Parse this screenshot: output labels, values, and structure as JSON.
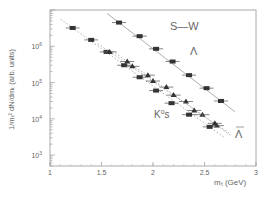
{
  "chart_data": {
    "type": "scatter",
    "title": "",
    "xlabel": "m_t (GeV)",
    "ylabel": "1/m_t^2 dN/dm_t (arb. units)",
    "xlim": [
      1,
      3
    ],
    "ylim": [
      500,
      10000000
    ],
    "yscale": "log",
    "x_ticks": [
      "1",
      "1.5",
      "2",
      "2.5",
      "3"
    ],
    "y_ticks": [
      "10^3",
      "10^4",
      "10^5",
      "10^6"
    ],
    "grid": false,
    "annotations": [
      "S-W",
      "Λ",
      "K°s",
      "Λ̄"
    ],
    "series": [
      {
        "name": "S-W (squares)",
        "marker": "square",
        "line": "solid",
        "x": [
          1.67,
          1.87,
          2.03,
          2.19,
          2.35,
          2.52,
          2.66
        ],
        "y": [
          4500000,
          1900000,
          850000,
          380000,
          160000,
          70000,
          31000
        ]
      },
      {
        "name": "Λ (triangles)",
        "marker": "triangle",
        "line": "dotted",
        "x": [
          1.75,
          1.95,
          2.13,
          2.32,
          2.48,
          2.62
        ],
        "y": [
          380000,
          160000,
          75000,
          30000,
          13000,
          6500
        ]
      },
      {
        "name": "K°s (squares)",
        "marker": "square",
        "line": "dotted",
        "x": [
          1.22,
          1.4,
          1.55,
          1.72,
          1.87,
          2.03,
          2.18,
          2.35,
          2.55
        ],
        "y": [
          3200000,
          1500000,
          700000,
          300000,
          140000,
          60000,
          27000,
          13000,
          6000
        ]
      },
      {
        "name": "Λ̄ (triangles)",
        "marker": "triangle",
        "line": "dotted",
        "x": [
          1.58,
          1.8,
          2.0,
          2.2,
          2.4,
          2.6
        ],
        "y": [
          700000,
          280000,
          110000,
          45000,
          17000,
          7500
        ]
      }
    ]
  },
  "labels": {
    "sw": "S—W",
    "lambda": "Λ",
    "k0s_k": "K",
    "k0s_sup": "o",
    "k0s_s": "s",
    "lambdabar": "Λ",
    "xlabel": "mₜ (GeV)",
    "ylabel": "1/mₜ² dN/dmₜ (arb. units)"
  }
}
